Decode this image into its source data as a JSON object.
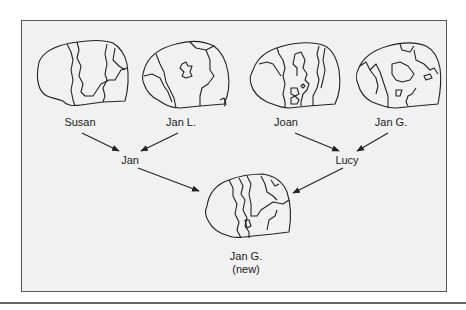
{
  "figure": {
    "sources": [
      {
        "id": "susan",
        "label": "Susan"
      },
      {
        "id": "jan-l",
        "label": "Jan L."
      },
      {
        "id": "joan",
        "label": "Joan"
      },
      {
        "id": "jan-g",
        "label": "Jan G."
      }
    ],
    "intermediates": [
      {
        "id": "jan",
        "label": "Jan",
        "from": [
          "Susan",
          "Jan L."
        ]
      },
      {
        "id": "lucy",
        "label": "Lucy",
        "from": [
          "Joan",
          "Jan G."
        ]
      }
    ],
    "result": {
      "label_line1": "Jan G.",
      "label_line2": "(new)",
      "from": [
        "Jan",
        "Lucy"
      ]
    }
  },
  "colors": {
    "background": "#f1f1f1",
    "ink": "#222222",
    "frame": "#555555"
  }
}
